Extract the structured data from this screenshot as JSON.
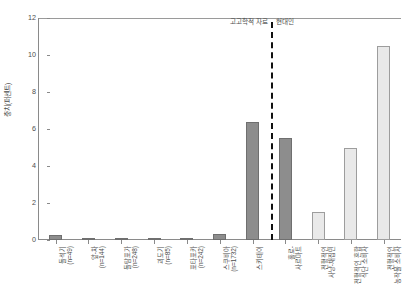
{
  "chart_data": {
    "type": "bar",
    "title": "",
    "xlabel": "",
    "ylabel": "충치(퍼센트)",
    "ylim": [
      0,
      12
    ],
    "yticks": [
      0,
      2,
      4,
      6,
      8,
      10,
      12
    ],
    "grid": false,
    "legend_position": "none",
    "categories": [
      "돌석기\n(n=49)",
      "앞-차\n(n=144)",
      "돌탐포가\n(n=248)",
      "괴도기\n(n=85)",
      "포타포카\n(n=242)",
      "스쿠비아\n(n=1732)",
      "스키테이",
      "홀로-\n사르마트",
      "전형적인\n사냥-채집민",
      "전형적인 혼합\n식단 소비자",
      "전형적인\n농작물 소비자"
    ],
    "values": [
      0.25,
      0.05,
      0.05,
      0.05,
      0.05,
      0.35,
      6.4,
      5.5,
      1.5,
      5.0,
      10.5
    ],
    "bar_styles": [
      "dark",
      "dark",
      "dark",
      "dark",
      "dark",
      "dark",
      "dark",
      "dark",
      "light",
      "light",
      "light"
    ],
    "annotations": [
      {
        "text": "고고학적 자료",
        "position": "left-of-divider"
      },
      {
        "text": "현대인",
        "position": "right-of-divider"
      }
    ],
    "divider": {
      "style": "dashed",
      "after_category_index": 7
    }
  },
  "colors": {
    "bar_dark_fill": "#8d8d8d",
    "bar_dark_stroke": "#6f6f6f",
    "bar_light_fill": "#e9e9e9",
    "bar_light_stroke": "#9d9d9d",
    "axis": "#8a8a8a",
    "text": "#4d4d4d",
    "divider": "#111111",
    "background": "#ffffff"
  }
}
